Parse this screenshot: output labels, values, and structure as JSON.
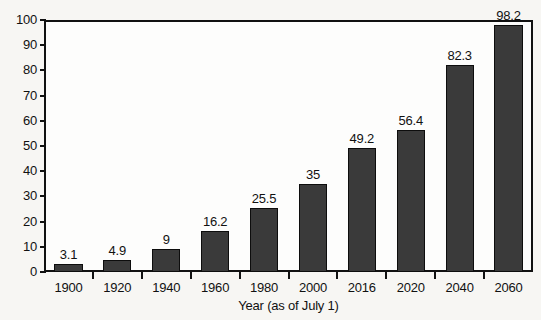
{
  "chart_data": {
    "type": "bar",
    "title": "",
    "xlabel": "Year (as of July 1)",
    "ylabel": "",
    "categories": [
      "1900",
      "1920",
      "1940",
      "1960",
      "1980",
      "2000",
      "2016",
      "2020",
      "2040",
      "2060"
    ],
    "values": [
      3.1,
      4.9,
      9,
      16.2,
      25.5,
      35,
      49.2,
      56.4,
      82.3,
      98.2
    ],
    "value_labels": [
      "3.1",
      "4.9",
      "9",
      "16.2",
      "25.5",
      "35",
      "49.2",
      "56.4",
      "82.3",
      "98.2"
    ],
    "ylim": [
      0,
      100
    ],
    "ytick_labels": [
      "100",
      "90",
      "80",
      "70",
      "60",
      "50",
      "40",
      "30",
      "20",
      "10",
      "0"
    ],
    "ytick_values": [
      100,
      90,
      80,
      70,
      60,
      50,
      40,
      30,
      20,
      10,
      0
    ],
    "grid": false,
    "legend": null,
    "bar_color": "#3a3a3a",
    "bar_edge_color": "#0d0d0d",
    "axis_color": "#111111",
    "background_color": "#f7f6f3",
    "plot_background_color": "#fdfdfc"
  }
}
